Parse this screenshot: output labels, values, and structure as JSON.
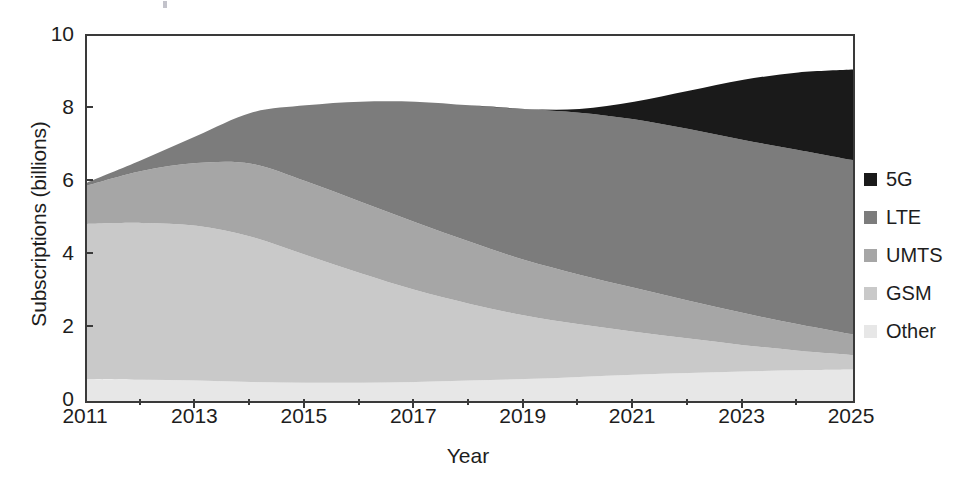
{
  "chart_data": {
    "type": "area",
    "stacked": true,
    "title": "",
    "xlabel": "Year",
    "ylabel": "Subscriptions (billions)",
    "xlim": [
      2011,
      2025
    ],
    "ylim": [
      0,
      10
    ],
    "grid": false,
    "legend_position": "right",
    "x": [
      2011,
      2012,
      2013,
      2014,
      2015,
      2016,
      2017,
      2018,
      2019,
      2020,
      2021,
      2022,
      2023,
      2024,
      2025
    ],
    "x_tick_labels": [
      "2011",
      "2013",
      "2015",
      "2017",
      "2019",
      "2021",
      "2023",
      "2025"
    ],
    "x_tick_values": [
      2011,
      2013,
      2015,
      2017,
      2019,
      2021,
      2023,
      2025
    ],
    "x_minor_tick_values": [
      2012,
      2014,
      2016,
      2018,
      2020,
      2022,
      2024
    ],
    "y_tick_labels": [
      "0",
      "2",
      "4",
      "6",
      "8",
      "10"
    ],
    "y_tick_values": [
      0,
      2,
      4,
      6,
      8,
      10
    ],
    "stack_order_bottom_to_top": [
      "Other",
      "GSM",
      "UMTS",
      "LTE",
      "5G"
    ],
    "series": [
      {
        "name": "Other",
        "color": "#e7e7e7",
        "values": [
          0.6,
          0.58,
          0.56,
          0.52,
          0.5,
          0.5,
          0.52,
          0.56,
          0.6,
          0.66,
          0.72,
          0.77,
          0.81,
          0.84,
          0.86
        ]
      },
      {
        "name": "GSM",
        "color": "#c9c9c9",
        "values": [
          4.25,
          4.3,
          4.24,
          3.98,
          3.5,
          3.0,
          2.52,
          2.1,
          1.74,
          1.44,
          1.18,
          0.94,
          0.72,
          0.54,
          0.4
        ]
      },
      {
        "name": "UMTS",
        "color": "#a6a6a6",
        "values": [
          1.05,
          1.42,
          1.72,
          2.0,
          2.02,
          1.96,
          1.86,
          1.7,
          1.52,
          1.36,
          1.2,
          1.04,
          0.88,
          0.72,
          0.56
        ]
      },
      {
        "name": "LTE",
        "color": "#7c7c7c",
        "values": [
          0.08,
          0.3,
          0.74,
          1.4,
          2.08,
          2.74,
          3.3,
          3.74,
          4.14,
          4.44,
          4.62,
          4.7,
          4.74,
          4.78,
          4.78
        ]
      },
      {
        "name": "5G",
        "color": "#1a1a1a",
        "values": [
          0.0,
          0.0,
          0.0,
          0.0,
          0.0,
          0.0,
          0.0,
          0.0,
          0.0,
          0.1,
          0.48,
          1.05,
          1.65,
          2.12,
          2.48
        ]
      }
    ],
    "totals": [
      5.98,
      6.6,
      7.26,
      7.9,
      8.1,
      8.2,
      8.2,
      8.1,
      8.0,
      8.0,
      8.2,
      8.5,
      8.8,
      9.0,
      9.08
    ]
  },
  "legend": {
    "items": [
      {
        "label": "5G",
        "color": "#1a1a1a"
      },
      {
        "label": "LTE",
        "color": "#7c7c7c"
      },
      {
        "label": "UMTS",
        "color": "#a6a6a6"
      },
      {
        "label": "GSM",
        "color": "#c9c9c9"
      },
      {
        "label": "Other",
        "color": "#e7e7e7"
      }
    ]
  }
}
